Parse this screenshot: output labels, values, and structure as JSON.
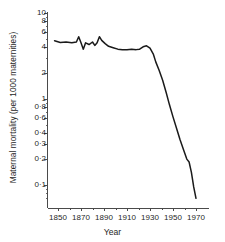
{
  "chart_data": {
    "type": "line",
    "title": "",
    "xlabel": "Year",
    "ylabel": "Maternal mortality (per 1000 maternities)",
    "yscale": "log",
    "ylim": [
      0.05,
      10
    ],
    "xlim": [
      1845,
      1975
    ],
    "grid": false,
    "legend": null,
    "y_tick_labels": [
      "10",
      "8",
      "6",
      "4",
      "2",
      "1",
      "0·8",
      "0·6",
      "0·4",
      "0·3",
      "0·2",
      "0·1"
    ],
    "y_tick_values": [
      10,
      8,
      6,
      4,
      2,
      1,
      0.8,
      0.6,
      0.4,
      0.3,
      0.2,
      0.1
    ],
    "x_tick_labels": [
      "1850",
      "1870",
      "1890",
      "1910",
      "1930",
      "1950",
      "1970"
    ],
    "x_tick_values": [
      1850,
      1870,
      1890,
      1910,
      1930,
      1950,
      1970
    ],
    "x_minor_ticks": [
      1860,
      1880,
      1900,
      1920,
      1940,
      1960
    ],
    "series": [
      {
        "name": "Maternal mortality",
        "color": "#1a1a1a",
        "x": [
          1847,
          1852,
          1857,
          1862,
          1866,
          1868,
          1870,
          1872,
          1874,
          1877,
          1880,
          1882,
          1884,
          1886,
          1888,
          1891,
          1894,
          1898,
          1902,
          1906,
          1910,
          1914,
          1918,
          1921,
          1924,
          1927,
          1930,
          1933,
          1935,
          1938,
          1941,
          1944,
          1947,
          1950,
          1953,
          1956,
          1959,
          1962,
          1964,
          1966,
          1968,
          1970
        ],
        "y": [
          4.75,
          4.55,
          4.6,
          4.5,
          4.6,
          5.3,
          4.5,
          3.8,
          4.5,
          4.3,
          4.6,
          4.2,
          4.5,
          5.3,
          4.8,
          4.4,
          4.1,
          3.95,
          3.8,
          3.75,
          3.75,
          3.8,
          3.75,
          3.8,
          4.05,
          4.15,
          3.9,
          3.3,
          2.7,
          2.15,
          1.65,
          1.2,
          0.85,
          0.62,
          0.46,
          0.34,
          0.26,
          0.2,
          0.185,
          0.14,
          0.095,
          0.07
        ]
      }
    ]
  },
  "axis": {
    "y_ticks": [
      {
        "label": "10",
        "value": 10
      },
      {
        "label": "8",
        "value": 8
      },
      {
        "label": "6",
        "value": 6
      },
      {
        "label": "4",
        "value": 4
      },
      {
        "label": "2",
        "value": 2
      },
      {
        "label": "1",
        "value": 1
      },
      {
        "label": "0·8",
        "value": 0.8
      },
      {
        "label": "0·6",
        "value": 0.6
      },
      {
        "label": "0·4",
        "value": 0.4
      },
      {
        "label": "0·3",
        "value": 0.3
      },
      {
        "label": "0·2",
        "value": 0.2
      },
      {
        "label": "0·1",
        "value": 0.1
      }
    ],
    "x_ticks": [
      {
        "label": "1850",
        "value": 1850
      },
      {
        "label": "1870",
        "value": 1870
      },
      {
        "label": "1890",
        "value": 1890
      },
      {
        "label": "1910",
        "value": 1910
      },
      {
        "label": "1930",
        "value": 1930
      },
      {
        "label": "1950",
        "value": 1950
      },
      {
        "label": "1970",
        "value": 1970
      }
    ]
  },
  "colors": {
    "line": "#1a1a1a",
    "axis": "#4a4a4a",
    "text": "#1f1f1f",
    "background": "#ffffff"
  }
}
